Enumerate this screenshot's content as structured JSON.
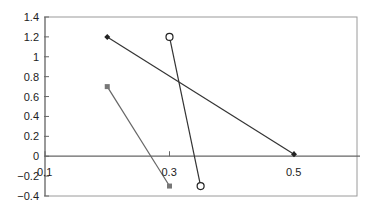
{
  "chart_data": {
    "type": "scatter",
    "title": "",
    "xlabel": "",
    "ylabel": "",
    "xlim": [
      0.1,
      0.6
    ],
    "ylim": [
      -0.4,
      1.4
    ],
    "grid": false,
    "legend": "none",
    "y_ticks": [
      "1.4",
      "1.2",
      "1",
      "0.8",
      "0.6",
      "0.4",
      "0.2",
      "0",
      "-0.2",
      "-0.4"
    ],
    "x_ticks": [
      "0.1",
      "0.3",
      "0.5"
    ],
    "series": [
      {
        "name": "Series 1",
        "marker": "diamond",
        "color": "#222222",
        "lines": true,
        "points": [
          {
            "x": 0.2,
            "y": 1.2
          },
          {
            "x": 0.5,
            "y": 0.02
          }
        ]
      },
      {
        "name": "Series 2",
        "marker": "square",
        "color": "#777777",
        "lines": true,
        "points": [
          {
            "x": 0.2,
            "y": 0.7
          },
          {
            "x": 0.3,
            "y": -0.3
          }
        ]
      },
      {
        "name": "Series 3",
        "marker": "open-circle",
        "color": "#222222",
        "lines": true,
        "points": [
          {
            "x": 0.3,
            "y": 1.2
          },
          {
            "x": 0.35,
            "y": -0.3
          }
        ]
      }
    ]
  }
}
